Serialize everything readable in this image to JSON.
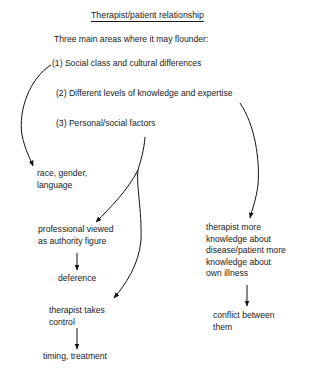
{
  "title": "Therapist/patient relationship",
  "intro": "Three main areas where it may flounder:",
  "areas": [
    "(1) Social class and cultural differences",
    "(2) Different levels of knowledge and expertise",
    "(3) Personal/social factors"
  ],
  "nodes": {
    "race": [
      "race, gender,",
      "language"
    ],
    "authority": [
      "professional viewed",
      "as authority figure"
    ],
    "deference": "deference",
    "control": [
      "therapist takes",
      "control"
    ],
    "timing": "timing, treatment",
    "knowledge": [
      "therapist more",
      "knowledge about",
      "disease/patient more",
      "knowledge about",
      "own illness"
    ],
    "conflict": [
      "conflict between",
      "them"
    ]
  },
  "edges": [
    {
      "from": "(1) Social class and cultural differences",
      "to": "race, gender, language"
    },
    {
      "from": "(3) Personal/social factors",
      "to": "professional viewed as authority figure"
    },
    {
      "from": "(3) Personal/social factors",
      "to": "therapist takes control"
    },
    {
      "from": "professional viewed as authority figure",
      "to": "deference"
    },
    {
      "from": "therapist takes control",
      "to": "timing, treatment"
    },
    {
      "from": "(2) Different levels of knowledge and expertise",
      "to": "therapist more knowledge about disease/patient more knowledge about own illness"
    },
    {
      "from": "therapist more knowledge about disease/patient more knowledge about own illness",
      "to": "conflict between them"
    }
  ]
}
